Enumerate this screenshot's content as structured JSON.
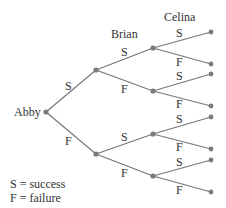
{
  "diagram": {
    "type": "probability-tree",
    "levels": [
      "Abby",
      "Brian",
      "Celina"
    ],
    "root_label": "Abby",
    "headers": {
      "brian": "Brian",
      "celina": "Celina"
    },
    "branch_labels": {
      "abby_s": "S",
      "abby_f": "F",
      "brian_top_s": "S",
      "brian_top_f": "F",
      "brian_bot_s": "S",
      "brian_bot_f": "F",
      "celina_1_s": "S",
      "celina_1_f": "F",
      "celina_2_s": "S",
      "celina_2_f": "F",
      "celina_3_s": "S",
      "celina_3_f": "F",
      "celina_4_s": "S",
      "celina_4_f": "F"
    },
    "legend": {
      "line1": "S = success",
      "line2": "F = failure"
    },
    "colors": {
      "line": "#777777",
      "node": "#7a7a7a",
      "text": "#333333"
    }
  }
}
